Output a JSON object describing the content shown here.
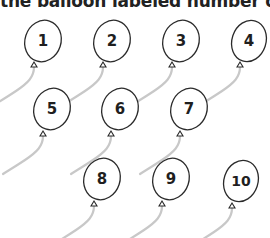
{
  "headline": "the balloon labeled number of",
  "colors": {
    "outline": "#2a2a2a",
    "string": "#c8c8c8",
    "label": "#1f1f1f",
    "background": "#ffffff"
  },
  "balloons": [
    {
      "label": "1",
      "cx": 43,
      "cy": 41,
      "rx": 18,
      "ry": 21,
      "knot_x": 34,
      "knot_y": 64
    },
    {
      "label": "2",
      "cx": 112,
      "cy": 41,
      "rx": 18,
      "ry": 21,
      "knot_x": 103,
      "knot_y": 64
    },
    {
      "label": "3",
      "cx": 181,
      "cy": 41,
      "rx": 18,
      "ry": 21,
      "knot_x": 172,
      "knot_y": 64
    },
    {
      "label": "4",
      "cx": 249,
      "cy": 41,
      "rx": 17,
      "ry": 21,
      "knot_x": 240,
      "knot_y": 64
    },
    {
      "label": "5",
      "cx": 52,
      "cy": 109,
      "rx": 18,
      "ry": 21,
      "knot_x": 43,
      "knot_y": 133
    },
    {
      "label": "6",
      "cx": 120,
      "cy": 109,
      "rx": 18,
      "ry": 21,
      "knot_x": 111,
      "knot_y": 133
    },
    {
      "label": "7",
      "cx": 189,
      "cy": 109,
      "rx": 18,
      "ry": 21,
      "knot_x": 180,
      "knot_y": 133
    },
    {
      "label": "8",
      "cx": 102,
      "cy": 179,
      "rx": 18,
      "ry": 21,
      "knot_x": 94,
      "knot_y": 203
    },
    {
      "label": "9",
      "cx": 171,
      "cy": 179,
      "rx": 18,
      "ry": 21,
      "knot_x": 162,
      "knot_y": 203
    },
    {
      "label": "10",
      "cx": 241,
      "cy": 181,
      "rx": 17,
      "ry": 21,
      "knot_x": 232,
      "knot_y": 205
    }
  ]
}
